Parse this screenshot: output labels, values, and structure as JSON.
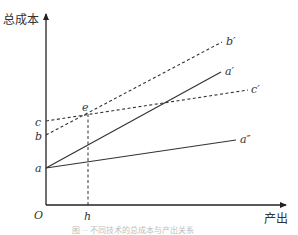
{
  "diagram": {
    "type": "cost-curves",
    "y_axis_label": "总成本",
    "x_axis_label": "产出",
    "origin_label": "O",
    "intercepts": [
      {
        "id": "a",
        "label": "a",
        "y": 168
      },
      {
        "id": "b",
        "label": "b",
        "y": 135
      },
      {
        "id": "c",
        "label": "c",
        "y": 121
      }
    ],
    "lines": [
      {
        "id": "a-prime",
        "label": "a′",
        "from": "a",
        "style": "solid",
        "x1": 46,
        "y1": 168,
        "x2": 221,
        "y2": 72
      },
      {
        "id": "a-double-prime",
        "label": "a″",
        "from": "a",
        "style": "solid",
        "x1": 46,
        "y1": 168,
        "x2": 236,
        "y2": 140
      },
      {
        "id": "b-prime",
        "label": "b′",
        "from": "b",
        "style": "dashed",
        "x1": 46,
        "y1": 135,
        "x2": 222,
        "y2": 42
      },
      {
        "id": "c-prime",
        "label": "c′",
        "from": "c",
        "style": "dashed",
        "x1": 46,
        "y1": 121,
        "x2": 248,
        "y2": 90
      }
    ],
    "intersection": {
      "label": "e",
      "x": 88,
      "y": 114
    },
    "x_marker": {
      "label": "h",
      "x": 88
    },
    "caption": "图 ·· 不同技术的总成本与产出关系"
  }
}
